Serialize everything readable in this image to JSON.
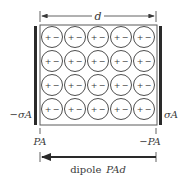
{
  "diagram": {
    "dimension_label": "d",
    "left_plate_charge": "−σA",
    "right_plate_charge": "σA",
    "left_surface_charge": "PA",
    "right_surface_charge": "−PA",
    "dipole_label_prefix": "dipole",
    "dipole_label_value": "PAd",
    "grid": {
      "rows": 4,
      "cols": 5,
      "molecule_sign_left": "+",
      "molecule_sign_right": "−"
    },
    "colors": {
      "ink": "#3a3a3a",
      "plate": "#2a2a2a",
      "background": "#ffffff"
    }
  }
}
